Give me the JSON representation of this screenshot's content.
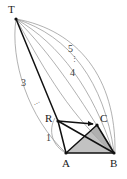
{
  "figure": {
    "type": "geometry-diagram",
    "width": 127,
    "height": 179,
    "background_color": "#ffffff",
    "stroke_color_bold": "#111111",
    "stroke_color_thin": "#8a8a8a",
    "shade_color": "#b8b8b8",
    "vertices": [
      {
        "id": "T",
        "label": "T",
        "x": 16,
        "y": 19,
        "label_x": 8,
        "label_y": 4
      },
      {
        "id": "R",
        "label": "R",
        "x": 58,
        "y": 121,
        "label_x": 45,
        "label_y": 113
      },
      {
        "id": "C",
        "label": "C",
        "x": 97,
        "y": 125,
        "label_x": 100,
        "label_y": 113
      },
      {
        "id": "A",
        "label": "A",
        "x": 66,
        "y": 153,
        "label_x": 62,
        "label_y": 158
      },
      {
        "id": "B",
        "label": "B",
        "x": 114,
        "y": 153,
        "label_x": 110,
        "label_y": 158
      }
    ],
    "arc_labels": [
      {
        "text": "5",
        "x": 68,
        "y": 44
      },
      {
        "text": "4",
        "x": 70,
        "y": 68
      },
      {
        "text": "3",
        "x": 21,
        "y": 78
      },
      {
        "text": "1",
        "x": 46,
        "y": 133
      }
    ],
    "ellipses": [
      {
        "kind": "vertical",
        "text": "⋮",
        "x": 71,
        "y": 56
      },
      {
        "kind": "diagonal",
        "text": "⋯",
        "x": 34,
        "y": 100
      }
    ],
    "segments": [
      {
        "from": "T",
        "to": "R",
        "weight": "bold"
      },
      {
        "from": "R",
        "to": "A",
        "weight": "bold"
      },
      {
        "from": "R",
        "to": "B",
        "weight": "bold"
      },
      {
        "from": "A",
        "to": "B",
        "weight": "bold"
      },
      {
        "from": "A",
        "to": "C",
        "weight": "bold"
      },
      {
        "from": "C",
        "to": "B",
        "weight": "bold"
      }
    ],
    "arrows": [
      {
        "from": "R",
        "to": "C",
        "weight": "bold",
        "arrowhead": true
      }
    ],
    "shaded_regions": [
      {
        "id": "triangle-R-C-B",
        "points": "R,C,B",
        "fill": "#b8b8b8"
      },
      {
        "id": "triangle-A-C-B",
        "points": "A,C,B",
        "fill": "#c4c4c4"
      }
    ],
    "arcs_from_T": 5
  }
}
